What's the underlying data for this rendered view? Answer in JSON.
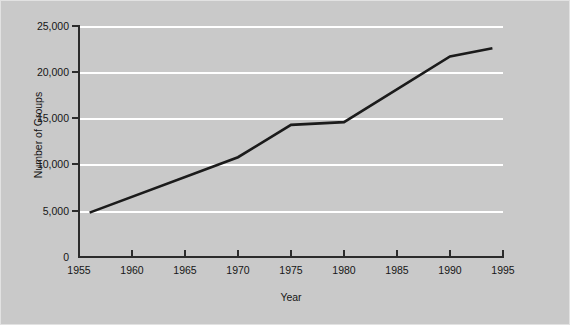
{
  "chart_data": {
    "type": "line",
    "title": "",
    "xlabel": "Year",
    "ylabel": "Number of Groups",
    "xlim": [
      1955,
      1995
    ],
    "ylim": [
      0,
      25000
    ],
    "grid": true,
    "legend": false,
    "x_ticks": [
      1955,
      1960,
      1965,
      1970,
      1975,
      1980,
      1985,
      1990,
      1995
    ],
    "x_tick_labels": [
      "1955",
      "1960",
      "1965",
      "1970",
      "1975",
      "1980",
      "1985",
      "1990",
      "1995"
    ],
    "y_ticks": [
      0,
      5000,
      10000,
      15000,
      20000,
      25000
    ],
    "y_tick_labels": [
      "0",
      "5,000",
      "10,000",
      "15,000",
      "20,000",
      "25,000"
    ],
    "series": [
      {
        "name": "Number of Groups",
        "color": "#1b1b1b",
        "line_width": 2.6,
        "x": [
          1956,
          1970,
          1975,
          1980,
          1990,
          1994
        ],
        "values": [
          4800,
          10800,
          14300,
          14600,
          21700,
          22600
        ]
      }
    ]
  },
  "figure": {
    "background_color": "#c9c9c9",
    "gridline_color": "#ffffff",
    "axis_color": "#2b2b2b",
    "border_color": "#e2e2e2"
  }
}
